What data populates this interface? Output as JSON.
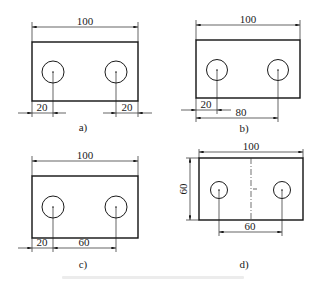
{
  "figure": {
    "panels": [
      {
        "id": "a",
        "caption": "a)",
        "width_dim": "100",
        "bottom_dims": [
          "20",
          "20"
        ]
      },
      {
        "id": "b",
        "caption": "b)",
        "width_dim": "100",
        "bottom_dims": [
          "20",
          "80"
        ]
      },
      {
        "id": "c",
        "caption": "c)",
        "width_dim": "100",
        "bottom_dims": [
          "20",
          "60"
        ]
      },
      {
        "id": "d",
        "caption": "d)",
        "width_dim": "100",
        "height_dim": "60",
        "bottom_dims": [
          "60"
        ]
      }
    ],
    "colors": {
      "line": "#1a1a1a",
      "background": "#ffffff"
    }
  }
}
